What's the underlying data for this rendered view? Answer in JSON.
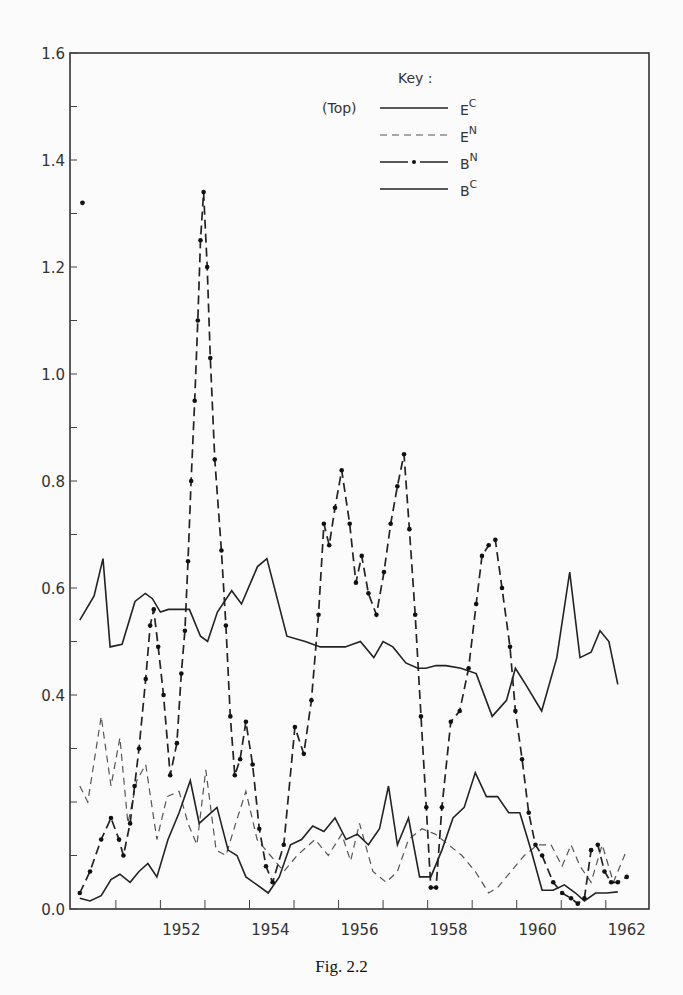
{
  "caption": "Fig. 2.2",
  "chart_data": {
    "type": "line",
    "title": "",
    "xlabel": "",
    "ylabel": "",
    "xlim": [
      1949.5,
      1962.5
    ],
    "ylim": [
      0.0,
      1.6
    ],
    "grid": false,
    "x_ticks": [
      1952,
      1954,
      1956,
      1958,
      1960,
      1962
    ],
    "x_minor_ticks_every": 1,
    "y_ticks": [
      0.0,
      0.2,
      0.4,
      0.6,
      0.8,
      1.0,
      1.2,
      1.4,
      1.6
    ],
    "y_tick_labels": [
      "0.0",
      "",
      "0.4",
      "0.6",
      "0.8",
      "1.0",
      "1.2",
      "1.4",
      "1.6"
    ],
    "legend": {
      "title": "Key :",
      "position": "top-right",
      "entries": [
        {
          "prefix": "(Top)",
          "label": "E",
          "sup": "C",
          "style": "solid"
        },
        {
          "prefix": "",
          "label": "E",
          "sup": "N",
          "style": "dashed"
        },
        {
          "prefix": "",
          "label": "B",
          "sup": "N",
          "style": "dash-dot"
        },
        {
          "prefix": "",
          "label": "B",
          "sup": "C",
          "style": "solid"
        }
      ]
    },
    "series": [
      {
        "name": "E^C",
        "style": "solid",
        "x": [
          1949.72,
          1950.04,
          1950.24,
          1950.4,
          1950.67,
          1950.96,
          1951.19,
          1951.35,
          1951.53,
          1951.71,
          1952.18,
          1952.43,
          1952.59,
          1952.81,
          1953.13,
          1953.35,
          1953.71,
          1953.92,
          1954.37,
          1954.78,
          1955.12,
          1955.68,
          1956.02,
          1956.32,
          1956.53,
          1956.75,
          1957.04,
          1957.31,
          1957.49,
          1957.72,
          1957.94,
          1958.28,
          1958.62,
          1958.98,
          1959.3,
          1959.5,
          1959.73,
          1959.98,
          1960.09,
          1960.43,
          1960.72,
          1960.95,
          1961.2,
          1961.4,
          1961.6,
          1961.8
        ],
        "y": [
          0.54,
          0.585,
          0.655,
          0.49,
          0.495,
          0.575,
          0.59,
          0.58,
          0.555,
          0.56,
          0.56,
          0.51,
          0.5,
          0.555,
          0.595,
          0.57,
          0.64,
          0.655,
          0.51,
          0.5,
          0.49,
          0.49,
          0.5,
          0.47,
          0.5,
          0.49,
          0.46,
          0.45,
          0.45,
          0.455,
          0.455,
          0.45,
          0.44,
          0.36,
          0.39,
          0.45,
          0.42,
          0.385,
          0.37,
          0.47,
          0.63,
          0.47,
          0.48,
          0.52,
          0.5,
          0.42
        ]
      },
      {
        "name": "E^N",
        "style": "dashed",
        "x": [
          1949.72,
          1949.9,
          1950.2,
          1950.42,
          1950.62,
          1950.8,
          1951.0,
          1951.2,
          1951.45,
          1951.68,
          1951.95,
          1952.15,
          1952.35,
          1952.55,
          1952.78,
          1953.0,
          1953.22,
          1953.45,
          1953.7,
          1954.0,
          1954.3,
          1954.6,
          1955.0,
          1955.3,
          1955.6,
          1955.8,
          1956.0,
          1956.3,
          1956.6,
          1956.85,
          1957.1,
          1957.4,
          1957.7,
          1958.0,
          1958.3,
          1958.6,
          1958.9,
          1959.1,
          1959.4,
          1959.7,
          1960.0,
          1960.3,
          1960.55,
          1960.75,
          1960.95,
          1961.2,
          1961.45,
          1961.7,
          1962.0
        ],
        "y": [
          0.23,
          0.2,
          0.36,
          0.23,
          0.32,
          0.16,
          0.24,
          0.27,
          0.13,
          0.21,
          0.22,
          0.16,
          0.12,
          0.26,
          0.11,
          0.1,
          0.16,
          0.22,
          0.13,
          0.1,
          0.07,
          0.1,
          0.13,
          0.1,
          0.14,
          0.09,
          0.16,
          0.07,
          0.05,
          0.07,
          0.13,
          0.15,
          0.14,
          0.12,
          0.1,
          0.07,
          0.03,
          0.04,
          0.07,
          0.1,
          0.12,
          0.12,
          0.08,
          0.12,
          0.08,
          0.05,
          0.12,
          0.05,
          0.11
        ]
      },
      {
        "name": "B^N",
        "style": "dash-dot",
        "x": [
          1949.72,
          1949.95,
          1950.2,
          1950.42,
          1950.6,
          1950.7,
          1950.85,
          1950.95,
          1951.05,
          1951.2,
          1951.3,
          1951.38,
          1951.48,
          1951.6,
          1951.75,
          1951.9,
          1952.0,
          1952.08,
          1952.15,
          1952.22,
          1952.3,
          1952.37,
          1952.43,
          1952.5,
          1952.58,
          1952.65,
          1952.75,
          1952.9,
          1953.0,
          1953.1,
          1953.2,
          1953.32,
          1953.45,
          1953.6,
          1953.75,
          1953.9,
          1954.05,
          1954.3,
          1954.55,
          1954.75,
          1954.92,
          1955.08,
          1955.2,
          1955.32,
          1955.45,
          1955.6,
          1955.78,
          1955.92,
          1956.05,
          1956.2,
          1956.38,
          1956.55,
          1956.7,
          1956.85,
          1957.0,
          1957.12,
          1957.25,
          1957.38,
          1957.5,
          1957.6,
          1957.72,
          1957.85,
          1958.05,
          1958.25,
          1958.45,
          1958.62,
          1958.75,
          1958.9,
          1959.05,
          1959.2,
          1959.38,
          1959.5,
          1959.65,
          1959.8,
          1959.95,
          1960.1,
          1960.35,
          1960.55,
          1960.75,
          1960.9,
          1961.05,
          1961.2,
          1961.35,
          1961.5,
          1961.65,
          1961.8,
          1962.0
        ],
        "y": [
          0.03,
          0.07,
          0.13,
          0.17,
          0.13,
          0.1,
          0.16,
          0.23,
          0.3,
          0.43,
          0.53,
          0.56,
          0.49,
          0.4,
          0.25,
          0.31,
          0.44,
          0.52,
          0.65,
          0.8,
          0.95,
          1.1,
          1.25,
          1.34,
          1.2,
          1.03,
          0.84,
          0.67,
          0.53,
          0.36,
          0.25,
          0.28,
          0.35,
          0.27,
          0.15,
          0.08,
          0.05,
          0.12,
          0.34,
          0.29,
          0.39,
          0.55,
          0.72,
          0.68,
          0.75,
          0.82,
          0.72,
          0.61,
          0.66,
          0.59,
          0.55,
          0.63,
          0.72,
          0.79,
          0.85,
          0.71,
          0.55,
          0.36,
          0.19,
          0.04,
          0.04,
          0.19,
          0.35,
          0.37,
          0.45,
          0.57,
          0.66,
          0.68,
          0.69,
          0.6,
          0.49,
          0.37,
          0.28,
          0.18,
          0.12,
          0.1,
          0.05,
          0.03,
          0.02,
          0.01,
          0.02,
          0.11,
          0.12,
          0.07,
          0.05,
          0.05,
          0.06
        ]
      },
      {
        "name": "B^C",
        "style": "solid",
        "x": [
          1949.72,
          1949.95,
          1950.2,
          1950.42,
          1950.62,
          1950.85,
          1951.05,
          1951.25,
          1951.45,
          1951.7,
          1951.95,
          1952.2,
          1952.4,
          1952.6,
          1952.8,
          1953.05,
          1953.25,
          1953.45,
          1953.7,
          1953.95,
          1954.2,
          1954.45,
          1954.7,
          1954.95,
          1955.2,
          1955.45,
          1955.7,
          1955.95,
          1956.2,
          1956.45,
          1956.65,
          1956.85,
          1957.1,
          1957.35,
          1957.6,
          1957.85,
          1958.1,
          1958.35,
          1958.6,
          1958.85,
          1959.1,
          1959.35,
          1959.6,
          1959.85,
          1960.1,
          1960.35,
          1960.6,
          1960.85,
          1961.05,
          1961.3,
          1961.55,
          1961.8
        ],
        "y": [
          0.02,
          0.015,
          0.025,
          0.055,
          0.065,
          0.05,
          0.07,
          0.085,
          0.06,
          0.13,
          0.18,
          0.24,
          0.16,
          0.175,
          0.19,
          0.11,
          0.1,
          0.06,
          0.045,
          0.03,
          0.06,
          0.12,
          0.13,
          0.155,
          0.145,
          0.17,
          0.13,
          0.14,
          0.12,
          0.15,
          0.23,
          0.12,
          0.17,
          0.06,
          0.06,
          0.11,
          0.17,
          0.19,
          0.255,
          0.21,
          0.21,
          0.18,
          0.18,
          0.11,
          0.035,
          0.035,
          0.045,
          0.03,
          0.015,
          0.03,
          0.03,
          0.032
        ]
      }
    ],
    "annotations": [
      {
        "text": "•",
        "note": "isolated B^N point near 1.32 at left edge",
        "x": 1949.78,
        "y": 1.32
      }
    ]
  }
}
